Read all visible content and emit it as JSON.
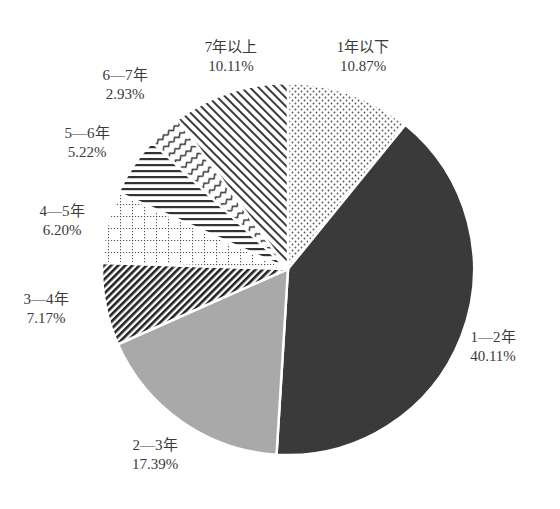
{
  "chart_data": {
    "type": "pie",
    "title": "",
    "start_angle_deg": 0,
    "direction": "clockwise",
    "categories": [
      "1年以下",
      "1—2年",
      "2—3年",
      "3—4年",
      "4—5年",
      "5—6年",
      "6—7年",
      "7年以上"
    ],
    "values": [
      10.87,
      40.11,
      17.39,
      7.17,
      6.2,
      5.22,
      2.93,
      10.11
    ],
    "labels": [
      "10.87%",
      "40.11%",
      "17.39%",
      "7.17%",
      "6.20%",
      "5.22%",
      "2.93%",
      "10.11%"
    ],
    "fills": [
      "dots",
      "dark-solid",
      "grey-solid",
      "dense-diagonal",
      "dotted-grid",
      "horizontal-lines",
      "wavy-lines",
      "diagonal-lines"
    ],
    "colors": {
      "dark": "#3a3a3a",
      "grey": "#a9a9a9",
      "pattern": "#444444",
      "edge": "#ffffff"
    },
    "legend": "none (direct labels)"
  },
  "labels": [
    {
      "name": "1年以下",
      "pct": "10.87%"
    },
    {
      "name": "1—2年",
      "pct": "40.11%"
    },
    {
      "name": "2—3年",
      "pct": "17.39%"
    },
    {
      "name": "3—4年",
      "pct": "7.17%"
    },
    {
      "name": "4—5年",
      "pct": "6.20%"
    },
    {
      "name": "5—6年",
      "pct": "5.22%"
    },
    {
      "name": "6—7年",
      "pct": "2.93%"
    },
    {
      "name": "7年以上",
      "pct": "10.11%"
    }
  ]
}
